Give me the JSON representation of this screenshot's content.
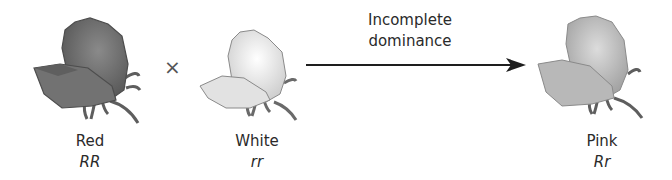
{
  "parents": [
    {
      "phenotype": "Red",
      "genotype": "RR",
      "color": "#6e6e6e"
    },
    {
      "phenotype": "White",
      "genotype": "rr",
      "color": "#e4e4e4"
    }
  ],
  "cross_symbol": "×",
  "arrow_label": {
    "line1": "Incomplete",
    "line2": "dominance"
  },
  "offspring": {
    "phenotype": "Pink",
    "genotype": "Rr",
    "color": "#b5b5b5"
  }
}
